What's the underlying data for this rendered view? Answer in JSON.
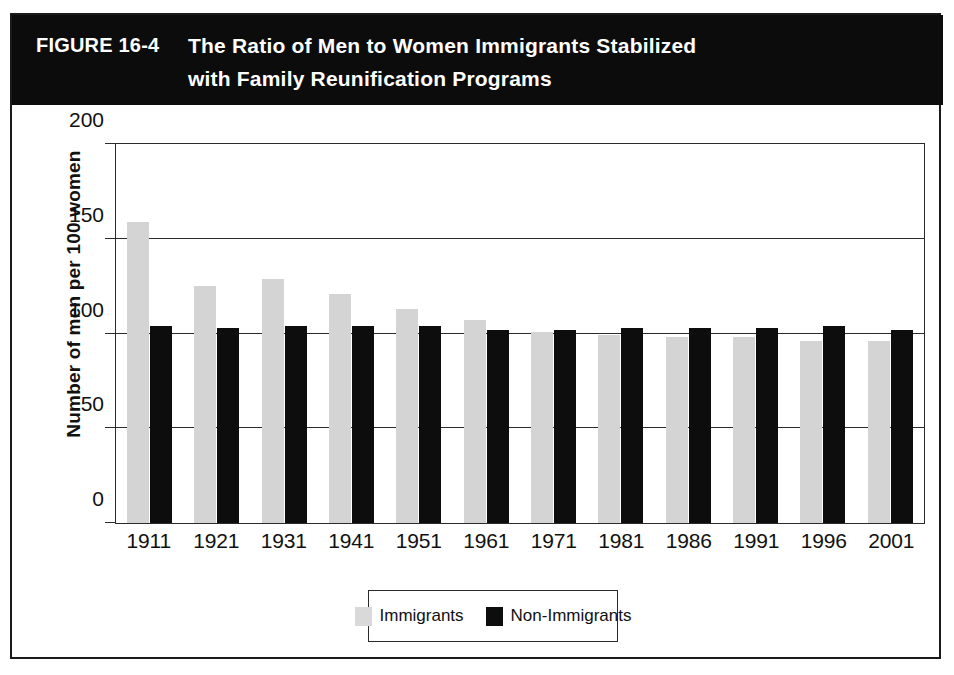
{
  "figure": {
    "label": "FIGURE 16-4",
    "title_lines": [
      "The Ratio of Men to Women Immigrants Stabilized",
      "with Family Reunification Programs"
    ]
  },
  "chart_data": {
    "type": "bar",
    "title": "The Ratio of Men to Women Immigrants Stabilized with Family Reunification Programs",
    "xlabel": "",
    "ylabel": "Number of men per 100 women",
    "ylim": [
      0,
      200
    ],
    "yticks": [
      0,
      50,
      100,
      150,
      200
    ],
    "grid": true,
    "legend_position": "bottom-center",
    "categories": [
      "1911",
      "1921",
      "1931",
      "1941",
      "1951",
      "1961",
      "1971",
      "1981",
      "1986",
      "1991",
      "1996",
      "2001"
    ],
    "series": [
      {
        "name": "Immigrants",
        "color": "#d4d4d4",
        "values": [
          159,
          125,
          129,
          121,
          113,
          107,
          101,
          99,
          98,
          98,
          96,
          96
        ]
      },
      {
        "name": "Non-Immigrants",
        "color": "#0d0d0d",
        "values": [
          104,
          103,
          104,
          104,
          104,
          102,
          102,
          103,
          103,
          103,
          104,
          102
        ]
      }
    ]
  },
  "legend": {
    "entries": [
      {
        "label": "Immigrants",
        "swatch": "light-gray-swatch"
      },
      {
        "label": "Non-Immigrants",
        "swatch": "black-swatch"
      }
    ]
  }
}
